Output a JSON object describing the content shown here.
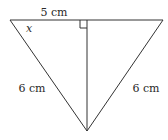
{
  "figure": {
    "type": "geometry-triangle",
    "colors": {
      "line": "#333333",
      "text": "#2a2a2a",
      "background": "#ffffff"
    },
    "labels": {
      "top_segment": "5 cm",
      "angle": "x",
      "left_side": "6 cm",
      "right_side": "6 cm"
    },
    "marks": {
      "right_angle": "right-angle-marker"
    }
  }
}
